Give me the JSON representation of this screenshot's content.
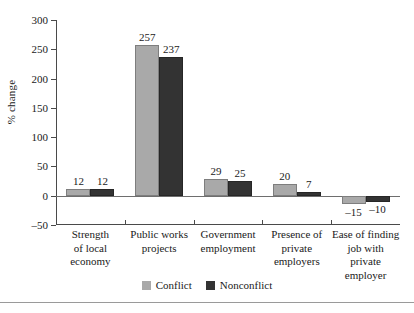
{
  "chart_data": {
    "type": "bar",
    "title": "",
    "xlabel": "",
    "ylabel": "% change",
    "ylim": [
      -50,
      300
    ],
    "yticks": [
      300,
      250,
      200,
      150,
      100,
      50,
      0,
      -50
    ],
    "ytick_labels": [
      "300",
      "250",
      "200",
      "150",
      "100",
      "50",
      "0",
      "–50"
    ],
    "grid": false,
    "legend_position": "bottom",
    "categories": [
      "Strength of local economy",
      "Public works projects",
      "Government employment",
      "Presence of private employers",
      "Ease of finding job with private employer"
    ],
    "category_lines": [
      [
        "Strength",
        "of local",
        "economy"
      ],
      [
        "Public works",
        "projects"
      ],
      [
        "Government",
        "employment"
      ],
      [
        "Presence of",
        "private",
        "employers"
      ],
      [
        "Ease of finding",
        "job with",
        "private",
        "employer"
      ]
    ],
    "series": [
      {
        "name": "Conflict",
        "color": "#a9a9a9",
        "values": [
          12,
          257,
          29,
          20,
          -15
        ],
        "value_labels": [
          "12",
          "257",
          "29",
          "20",
          "–15"
        ]
      },
      {
        "name": "Nonconflict",
        "color": "#333333",
        "values": [
          12,
          237,
          25,
          7,
          -10
        ],
        "value_labels": [
          "12",
          "237",
          "25",
          "7",
          "–10"
        ]
      }
    ]
  },
  "legend": {
    "items": [
      {
        "label": "Conflict",
        "color": "#a9a9a9"
      },
      {
        "label": "Nonconflict",
        "color": "#333333"
      }
    ]
  }
}
